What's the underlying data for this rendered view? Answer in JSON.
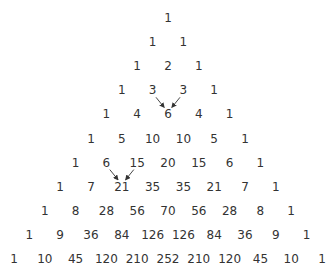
{
  "rows": [
    [
      1
    ],
    [
      1,
      1
    ],
    [
      1,
      2,
      1
    ],
    [
      1,
      3,
      3,
      1
    ],
    [
      1,
      4,
      6,
      4,
      1
    ],
    [
      1,
      5,
      10,
      10,
      5,
      1
    ],
    [
      1,
      6,
      15,
      20,
      15,
      6,
      1
    ],
    [
      1,
      7,
      21,
      35,
      35,
      21,
      7,
      1
    ],
    [
      1,
      8,
      28,
      56,
      70,
      56,
      28,
      8,
      1
    ],
    [
      1,
      9,
      36,
      84,
      126,
      126,
      84,
      36,
      9,
      1
    ],
    [
      1,
      10,
      45,
      120,
      210,
      252,
      210,
      120,
      45,
      10,
      1
    ]
  ],
  "arrows": [
    {
      "from": [
        3,
        1
      ],
      "to": [
        4,
        2
      ]
    },
    {
      "from": [
        3,
        2
      ],
      "to": [
        4,
        2
      ]
    },
    {
      "from": [
        6,
        1
      ],
      "to": [
        7,
        2
      ]
    },
    {
      "from": [
        6,
        2
      ],
      "to": [
        7,
        2
      ]
    }
  ],
  "colors": {
    "text": "#333333",
    "arrow": "#333333",
    "background": "#ffffff"
  }
}
